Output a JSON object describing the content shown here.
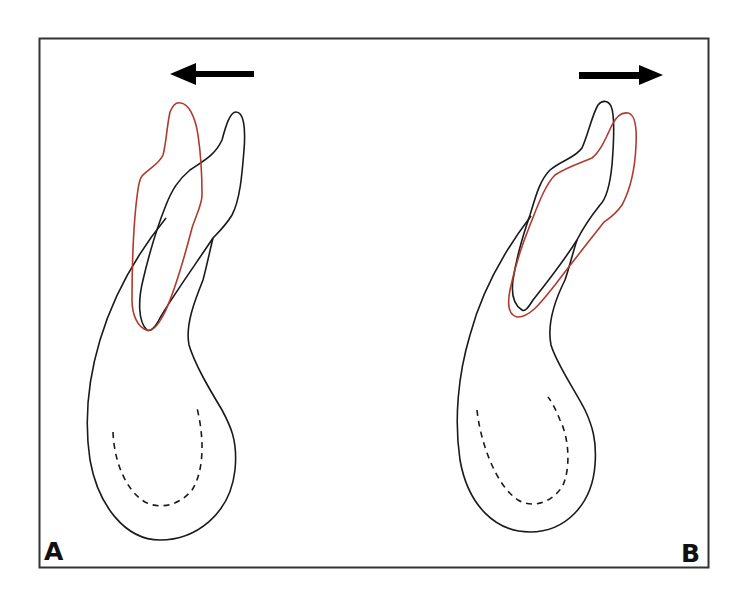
{
  "figure": {
    "type": "dental diagram",
    "colors": {
      "frame": "#333333",
      "original_outline": "#1a1a1a",
      "moved_outline": "#b03a2e",
      "arrow": "#000000",
      "background": "#ffffff"
    },
    "panels": [
      {
        "label": "A",
        "arrow_direction": "left",
        "description": "Root tipped toward the left (red outline), original position in black"
      },
      {
        "label": "B",
        "arrow_direction": "right",
        "description": "Root tipped toward the right (red outline), original position in black"
      }
    ]
  }
}
